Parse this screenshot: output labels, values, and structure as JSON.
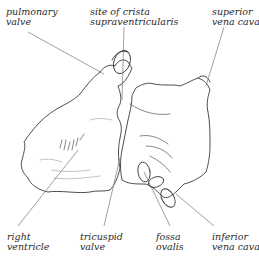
{
  "diagram": {
    "labels": [
      {
        "id": "pulmonary-valve",
        "lines": [
          "pulmonary",
          "valve"
        ]
      },
      {
        "id": "crista",
        "lines": [
          "site of crista",
          "supraventricularis"
        ]
      },
      {
        "id": "svc",
        "lines": [
          "superior",
          "vena cava"
        ]
      },
      {
        "id": "right-ventricle",
        "lines": [
          "right",
          "ventricle"
        ]
      },
      {
        "id": "tricuspid-valve",
        "lines": [
          "tricuspid",
          "valve"
        ]
      },
      {
        "id": "fossa-ovalis",
        "lines": [
          "fossa",
          "ovalis"
        ]
      },
      {
        "id": "ivc",
        "lines": [
          "inferior",
          "vena cava"
        ]
      }
    ]
  }
}
